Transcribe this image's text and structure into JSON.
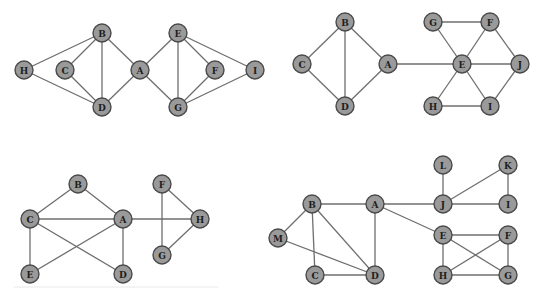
{
  "colors": {
    "node_fill": "#9a9a9a",
    "node_stroke": "#4a4a4a",
    "edge": "#6e6e6e",
    "label": "#1e1e1e",
    "background": "#ffffff"
  },
  "node_radius": 9,
  "graphs": [
    {
      "id": "graph-1",
      "nodes": [
        {
          "id": "H",
          "x": 24,
          "y": 70
        },
        {
          "id": "C",
          "x": 65,
          "y": 70
        },
        {
          "id": "B",
          "x": 102,
          "y": 33
        },
        {
          "id": "D",
          "x": 102,
          "y": 107
        },
        {
          "id": "A",
          "x": 140,
          "y": 70
        },
        {
          "id": "E",
          "x": 178,
          "y": 33
        },
        {
          "id": "G",
          "x": 178,
          "y": 107
        },
        {
          "id": "F",
          "x": 215,
          "y": 70
        },
        {
          "id": "I",
          "x": 255,
          "y": 70
        }
      ],
      "edges": [
        [
          "H",
          "B"
        ],
        [
          "H",
          "D"
        ],
        [
          "C",
          "B"
        ],
        [
          "C",
          "D"
        ],
        [
          "B",
          "D"
        ],
        [
          "B",
          "A"
        ],
        [
          "D",
          "A"
        ],
        [
          "A",
          "E"
        ],
        [
          "A",
          "G"
        ],
        [
          "E",
          "G"
        ],
        [
          "E",
          "F"
        ],
        [
          "E",
          "I"
        ],
        [
          "F",
          "G"
        ],
        [
          "I",
          "G"
        ]
      ]
    },
    {
      "id": "graph-2",
      "nodes": [
        {
          "id": "B",
          "x": 345,
          "y": 22
        },
        {
          "id": "C",
          "x": 302,
          "y": 64
        },
        {
          "id": "A",
          "x": 388,
          "y": 64
        },
        {
          "id": "D",
          "x": 345,
          "y": 106
        },
        {
          "id": "G",
          "x": 433,
          "y": 22
        },
        {
          "id": "F",
          "x": 490,
          "y": 22
        },
        {
          "id": "E",
          "x": 462,
          "y": 64
        },
        {
          "id": "J",
          "x": 520,
          "y": 64
        },
        {
          "id": "H",
          "x": 433,
          "y": 106
        },
        {
          "id": "I",
          "x": 490,
          "y": 106
        }
      ],
      "edges": [
        [
          "B",
          "C"
        ],
        [
          "B",
          "A"
        ],
        [
          "B",
          "D"
        ],
        [
          "C",
          "D"
        ],
        [
          "A",
          "D"
        ],
        [
          "A",
          "E"
        ],
        [
          "G",
          "F"
        ],
        [
          "G",
          "E"
        ],
        [
          "F",
          "E"
        ],
        [
          "F",
          "J"
        ],
        [
          "E",
          "J"
        ],
        [
          "E",
          "H"
        ],
        [
          "E",
          "I"
        ],
        [
          "H",
          "I"
        ],
        [
          "I",
          "J"
        ]
      ]
    },
    {
      "id": "graph-3",
      "nodes": [
        {
          "id": "B",
          "x": 78,
          "y": 184
        },
        {
          "id": "F",
          "x": 162,
          "y": 184
        },
        {
          "id": "C",
          "x": 30,
          "y": 219
        },
        {
          "id": "A",
          "x": 123,
          "y": 219
        },
        {
          "id": "H",
          "x": 200,
          "y": 219
        },
        {
          "id": "G",
          "x": 162,
          "y": 255
        },
        {
          "id": "E",
          "x": 30,
          "y": 274
        },
        {
          "id": "D",
          "x": 123,
          "y": 274
        }
      ],
      "edges": [
        [
          "B",
          "C"
        ],
        [
          "B",
          "A"
        ],
        [
          "C",
          "A"
        ],
        [
          "A",
          "H"
        ],
        [
          "C",
          "E"
        ],
        [
          "C",
          "D"
        ],
        [
          "A",
          "E"
        ],
        [
          "A",
          "D"
        ],
        [
          "F",
          "H"
        ],
        [
          "F",
          "G"
        ],
        [
          "G",
          "H"
        ]
      ]
    },
    {
      "id": "graph-4",
      "nodes": [
        {
          "id": "L",
          "x": 443,
          "y": 165
        },
        {
          "id": "K",
          "x": 508,
          "y": 165
        },
        {
          "id": "B",
          "x": 312,
          "y": 204
        },
        {
          "id": "A",
          "x": 375,
          "y": 204
        },
        {
          "id": "J",
          "x": 443,
          "y": 204
        },
        {
          "id": "I",
          "x": 508,
          "y": 204
        },
        {
          "id": "M",
          "x": 278,
          "y": 238
        },
        {
          "id": "E",
          "x": 443,
          "y": 235
        },
        {
          "id": "F",
          "x": 508,
          "y": 235
        },
        {
          "id": "C",
          "x": 315,
          "y": 275
        },
        {
          "id": "D",
          "x": 375,
          "y": 275
        },
        {
          "id": "H",
          "x": 443,
          "y": 275
        },
        {
          "id": "G",
          "x": 508,
          "y": 275
        }
      ],
      "edges": [
        [
          "B",
          "A"
        ],
        [
          "B",
          "M"
        ],
        [
          "B",
          "C"
        ],
        [
          "B",
          "D"
        ],
        [
          "M",
          "D"
        ],
        [
          "C",
          "D"
        ],
        [
          "A",
          "D"
        ],
        [
          "A",
          "J"
        ],
        [
          "A",
          "E"
        ],
        [
          "L",
          "J"
        ],
        [
          "J",
          "K"
        ],
        [
          "J",
          "I"
        ],
        [
          "K",
          "I"
        ],
        [
          "E",
          "F"
        ],
        [
          "E",
          "H"
        ],
        [
          "E",
          "G"
        ],
        [
          "F",
          "H"
        ],
        [
          "F",
          "G"
        ],
        [
          "H",
          "G"
        ]
      ]
    }
  ],
  "dividers": [
    {
      "x1": 14,
      "y1": 287,
      "x2": 218,
      "y2": 287
    }
  ]
}
